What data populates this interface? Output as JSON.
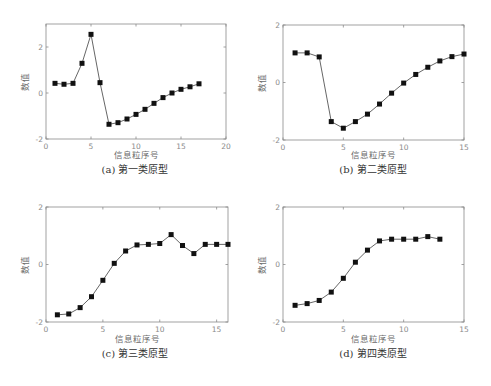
{
  "figure": {
    "captions": [
      "(a) 第一类原型",
      "(b) 第二类原型",
      "(c) 第三类原型",
      "(d) 第四类原型"
    ]
  },
  "chart_data": [
    {
      "type": "line",
      "title": "(a) 第一类原型",
      "xlabel": "信息粒序号",
      "ylabel": "数值",
      "xlim": [
        0,
        20
      ],
      "ylim": [
        -2,
        3
      ],
      "xticks": [
        0,
        5,
        10,
        15,
        20
      ],
      "yticks": [
        -2,
        0,
        2
      ],
      "marker": "square",
      "grid": false,
      "x": [
        1,
        2,
        3,
        4,
        5,
        6,
        7,
        8,
        9,
        10,
        11,
        12,
        13,
        14,
        15,
        16,
        17
      ],
      "values": [
        0.42,
        0.38,
        0.42,
        1.29,
        2.55,
        0.45,
        -1.36,
        -1.29,
        -1.13,
        -0.93,
        -0.71,
        -0.45,
        -0.2,
        0.0,
        0.16,
        0.27,
        0.4
      ]
    },
    {
      "type": "line",
      "title": "(b) 第二类原型",
      "xlabel": "信息粒序号",
      "ylabel": "数值",
      "xlim": [
        0,
        15
      ],
      "ylim": [
        -2,
        2
      ],
      "xticks": [
        0,
        5,
        10,
        15
      ],
      "yticks": [
        -2,
        0,
        2
      ],
      "marker": "square",
      "grid": false,
      "x": [
        1,
        2,
        3,
        4,
        5,
        6,
        7,
        8,
        9,
        10,
        11,
        12,
        13,
        14,
        15
      ],
      "values": [
        1.03,
        1.03,
        0.89,
        -1.36,
        -1.59,
        -1.36,
        -1.1,
        -0.75,
        -0.37,
        -0.02,
        0.28,
        0.53,
        0.75,
        0.9,
        0.99
      ]
    },
    {
      "type": "line",
      "title": "(c) 第三类原型",
      "xlabel": "信息粒序号",
      "ylabel": "数值",
      "xlim": [
        0,
        16
      ],
      "ylim": [
        -2,
        2
      ],
      "xticks": [
        0,
        5,
        10,
        15
      ],
      "yticks": [
        -2,
        0,
        2
      ],
      "marker": "square",
      "grid": false,
      "x": [
        1,
        2,
        3,
        4,
        5,
        6,
        7,
        8,
        9,
        10,
        11,
        12,
        13,
        14,
        15,
        16
      ],
      "values": [
        -1.75,
        -1.72,
        -1.5,
        -1.12,
        -0.55,
        0.04,
        0.47,
        0.68,
        0.7,
        0.73,
        1.04,
        0.66,
        0.38,
        0.7,
        0.7,
        0.7
      ]
    },
    {
      "type": "line",
      "title": "(d) 第四类原型",
      "xlabel": "信息粒序号",
      "ylabel": "数值",
      "xlim": [
        0,
        15
      ],
      "ylim": [
        -2,
        2
      ],
      "xticks": [
        0,
        5,
        10,
        15
      ],
      "yticks": [
        -2,
        0,
        2
      ],
      "marker": "square",
      "grid": false,
      "x": [
        1,
        2,
        3,
        4,
        5,
        6,
        7,
        8,
        9,
        10,
        11,
        12,
        13
      ],
      "values": [
        -1.42,
        -1.36,
        -1.25,
        -0.96,
        -0.48,
        0.08,
        0.5,
        0.82,
        0.88,
        0.88,
        0.88,
        0.97,
        0.88
      ]
    }
  ]
}
